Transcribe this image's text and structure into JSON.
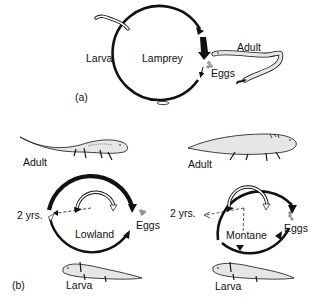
{
  "panel_a": {
    "marker": "(a)",
    "title": "Lamprey",
    "labels": {
      "larva": "Larva",
      "adult": "Adult",
      "eggs": "Eggs"
    }
  },
  "panel_b": {
    "marker": "(b)",
    "lowland": {
      "title": "Lowland",
      "labels": {
        "adult": "Adult",
        "duration": "2 yrs.",
        "eggs": "Eggs",
        "larva": "Larva"
      }
    },
    "montane": {
      "title": "Montane",
      "labels": {
        "adult": "Adult",
        "duration": "2 yrs.",
        "eggs": "Eggs",
        "larva": "Larva"
      }
    }
  },
  "colors": {
    "ink": "#111111",
    "animal_fill": "#e6e6e6"
  }
}
